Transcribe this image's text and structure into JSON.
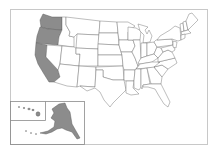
{
  "map": {
    "title": "",
    "colors": {
      "highlight": "#8c8c8c",
      "default": "#ffffff",
      "border": "#6e6e6e",
      "frame": "#c8c8c8"
    },
    "highlighted_states": [
      "Washington",
      "Oregon",
      "California",
      "Alaska",
      "Hawaii"
    ],
    "insets": [
      "Alaska",
      "Hawaii"
    ]
  }
}
